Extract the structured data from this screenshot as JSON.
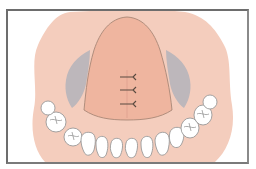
{
  "figure": {
    "colors": {
      "frame": "#6d6d6d",
      "background": "#ffffff",
      "mucosa_outer": "#f4cdbd",
      "palate_flap": "#efb59f",
      "flap_outline": "#a08070",
      "exposed_bone": "#bdb7bb",
      "suture": "#5a4a40",
      "tooth_fill": "#ffffff",
      "tooth_outline": "#9a9a9a"
    },
    "sutures": [
      {
        "x": 127,
        "y": 77
      },
      {
        "x": 127,
        "y": 90
      },
      {
        "x": 127,
        "y": 104
      }
    ],
    "teeth_count": 14
  }
}
